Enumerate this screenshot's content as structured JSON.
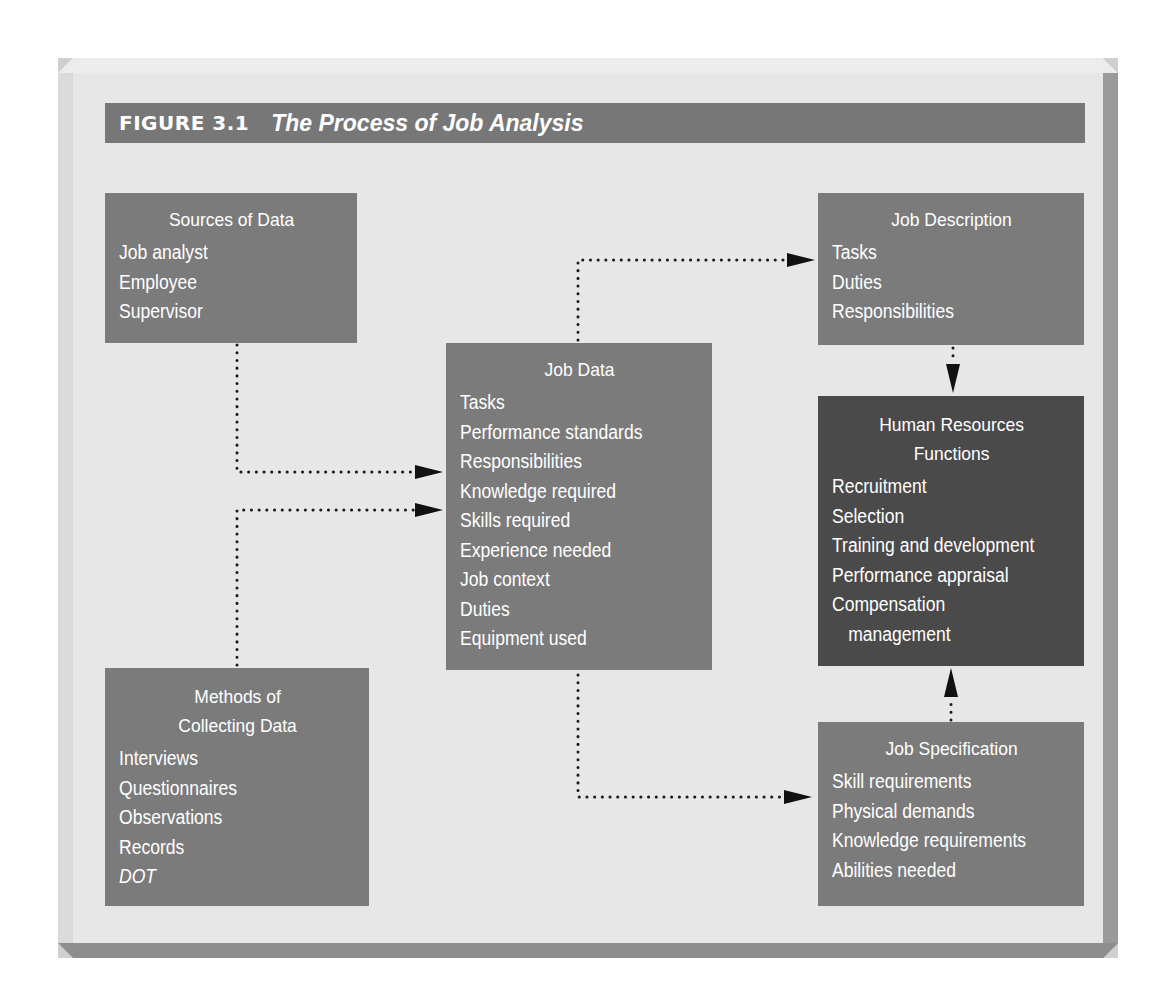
{
  "figure": {
    "label": "FIGURE 3.1",
    "title": "The Process of Job Analysis"
  },
  "boxes": {
    "sources": {
      "title": "Sources of Data",
      "items": [
        "Job analyst",
        "Employee",
        "Supervisor"
      ]
    },
    "methods": {
      "title_line1": "Methods of",
      "title_line2": "Collecting Data",
      "items": [
        "Interviews",
        "Questionnaires",
        "Observations",
        "Records",
        "DOT"
      ]
    },
    "job_data": {
      "title": "Job Data",
      "items": [
        "Tasks",
        "Performance standards",
        "Responsibilities",
        "Knowledge required",
        "Skills required",
        "Experience needed",
        "Job context",
        "Duties",
        "Equipment used"
      ]
    },
    "job_description": {
      "title": "Job Description",
      "items": [
        "Tasks",
        "Duties",
        "Responsibilities"
      ]
    },
    "hr_functions": {
      "title_line1": "Human Resources",
      "title_line2": "Functions",
      "items": [
        "Recruitment",
        "Selection",
        "Training and development",
        "Performance appraisal",
        "Compensation",
        "management"
      ]
    },
    "job_specification": {
      "title": "Job Specification",
      "items": [
        "Skill requirements",
        "Physical demands",
        "Knowledge requirements",
        "Abilities needed"
      ]
    }
  },
  "connections": [
    {
      "from": "Sources of Data",
      "to": "Job Data",
      "style": "dotted"
    },
    {
      "from": "Methods of Collecting Data",
      "to": "Job Data",
      "style": "dotted"
    },
    {
      "from": "Job Data",
      "to": "Job Description",
      "style": "dotted"
    },
    {
      "from": "Job Data",
      "to": "Job Specification",
      "style": "dotted"
    },
    {
      "from": "Job Description",
      "to": "Human Resources Functions",
      "style": "dotted"
    },
    {
      "from": "Job Specification",
      "to": "Human Resources Functions",
      "style": "dotted"
    }
  ],
  "colors": {
    "box_fill": "#7b7b7b",
    "hr_box_fill": "#4a4a4a",
    "title_bar": "#777777",
    "panel": "#e7e7e7",
    "text": "#ffffff",
    "arrow": "#111111"
  }
}
